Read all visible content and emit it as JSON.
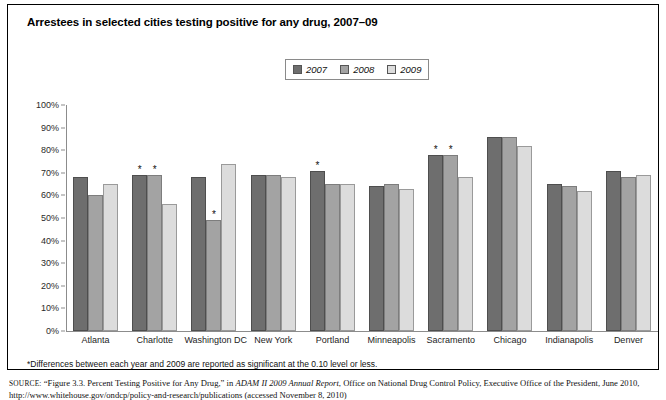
{
  "figure": {
    "title": "Arrestees in selected cities testing positive for any drug, 2007–09",
    "footnote": "*Differences between each year and 2009 are reported as significant at the 0.10 level or less.",
    "source_label": "SOURCE:",
    "source_text_1": "“Figure 3.3. Percent Testing Positive for Any Drug,” in ",
    "source_italic_1": "ADAM II 2009 Annual Report",
    "source_text_2": ", Office on National Drug Control Policy, Executive Office",
    "source_line_2": "of the President, June 2010, http://www.whitehouse.gov/ondcp/policy-and-research/publications (accessed November 8, 2010)"
  },
  "colors": {
    "y2007": "#6e6e6e",
    "y2008": "#a3a3a3",
    "y2009": "#dcdcdc",
    "axis": "#8c8c8c",
    "frame": "#000000"
  },
  "legend": {
    "items": [
      {
        "label": "2007",
        "color": "#6e6e6e",
        "key": "y2007"
      },
      {
        "label": "2008",
        "color": "#a3a3a3",
        "key": "y2008"
      },
      {
        "label": "2009",
        "color": "#dcdcdc",
        "key": "y2009"
      }
    ]
  },
  "chart_data": {
    "type": "bar",
    "title": "Arrestees in selected cities testing positive for any drug, 2007–09",
    "xlabel": "",
    "ylabel": "",
    "ylim": [
      0,
      100
    ],
    "ytick_labels": [
      "100%",
      "90%",
      "80%",
      "70%",
      "60%",
      "50%",
      "40%",
      "30%",
      "20%",
      "10%",
      "0%"
    ],
    "ytick_values": [
      100,
      90,
      80,
      70,
      60,
      50,
      40,
      30,
      20,
      10,
      0
    ],
    "grid": false,
    "legend_position": "top-center",
    "categories": [
      "Atlanta",
      "Charlotte",
      "Washington DC",
      "New York",
      "Portland",
      "Minneapolis",
      "Sacramento",
      "Chicago",
      "Indianapolis",
      "Denver"
    ],
    "series": [
      {
        "name": "2007",
        "values": [
          68,
          69,
          68,
          69,
          71,
          64,
          78,
          86,
          65,
          71
        ]
      },
      {
        "name": "2008",
        "values": [
          60,
          69,
          49,
          69,
          65,
          65,
          78,
          86,
          64,
          68
        ]
      },
      {
        "name": "2009",
        "values": [
          65,
          56,
          74,
          68,
          65,
          63,
          68,
          82,
          62,
          69
        ]
      }
    ],
    "significance_markers": [
      {
        "category": "Charlotte",
        "series": "2007",
        "marker": "*"
      },
      {
        "category": "Charlotte",
        "series": "2008",
        "marker": "*"
      },
      {
        "category": "Washington DC",
        "series": "2008",
        "marker": "*"
      },
      {
        "category": "Portland",
        "series": "2007",
        "marker": "*"
      },
      {
        "category": "Sacramento",
        "series": "2007",
        "marker": "*"
      },
      {
        "category": "Sacramento",
        "series": "2008",
        "marker": "*"
      }
    ]
  }
}
